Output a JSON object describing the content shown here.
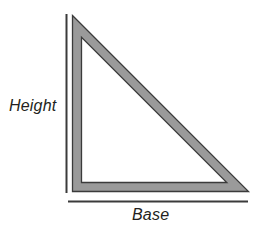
{
  "diagram": {
    "shape": "right triangle",
    "background_color": "#ffffff",
    "band_fill_color": "#9a9a9a",
    "band_stroke_color": "#3b3b3b",
    "rule_color": "#3b3b3b",
    "text_color": "#231f20",
    "labels": {
      "height": "Height",
      "base": "Base"
    },
    "geometry": {
      "top_vertex": [
        78,
        22
      ],
      "bottom_left_vertex": [
        78,
        188
      ],
      "bottom_right_vertex": [
        242,
        188
      ],
      "band_thickness": 8,
      "height_rule": {
        "x": 69.5,
        "y1": 14,
        "y2": 193
      },
      "base_rule": {
        "y": 201.5,
        "x1": 68,
        "x2": 248
      }
    }
  }
}
